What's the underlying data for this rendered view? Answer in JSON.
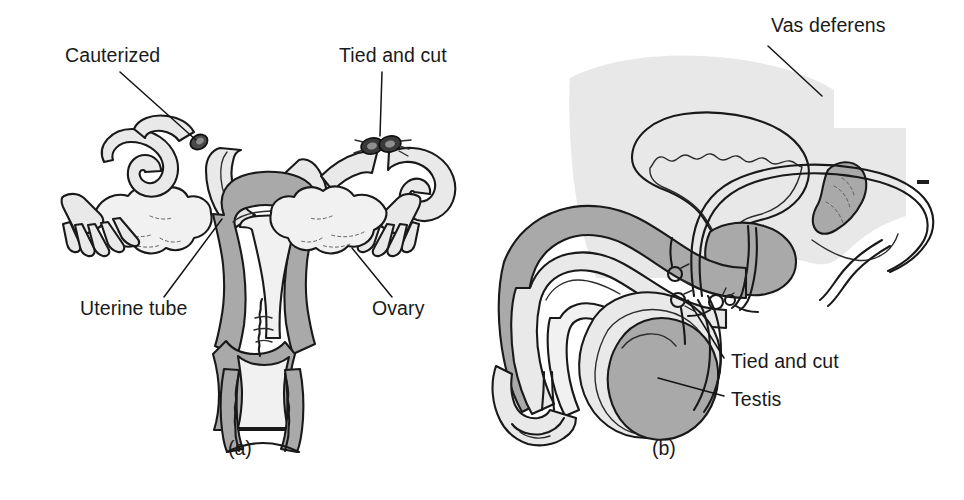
{
  "figure": {
    "background_color": "#ffffff",
    "ink_color": "#191919",
    "fill_mid_color": "#a9a9a9",
    "fill_light_color": "#e9e9e9",
    "fill_background_color": "#e8e8e8"
  },
  "panels": [
    {
      "id": "a",
      "caption": "(a)",
      "subject": "female-reproductive-tract",
      "labels": [
        {
          "name": "cauterized",
          "text": "Cauterized",
          "x": 65,
          "y": 56,
          "points_to": "left-uterine-tube-cut-end"
        },
        {
          "name": "tied-and-cut",
          "text": "Tied and cut",
          "x": 339,
          "y": 56,
          "points_to": "right-uterine-tube-ligature"
        },
        {
          "name": "uterine-tube",
          "text": "Uterine tube",
          "x": 80,
          "y": 309,
          "points_to": "left-uterine-tube"
        },
        {
          "name": "ovary",
          "text": "Ovary",
          "x": 372,
          "y": 309,
          "points_to": "right-ovary"
        }
      ],
      "structures": [
        "uterus",
        "uterine-cavity",
        "cervix",
        "vagina",
        "left-uterine-tube",
        "right-uterine-tube",
        "left-ovary",
        "right-ovary",
        "left-fimbriae",
        "right-fimbriae"
      ]
    },
    {
      "id": "b",
      "caption": "(b)",
      "subject": "male-reproductive-tract",
      "labels": [
        {
          "name": "vas-deferens",
          "text": "Vas deferens",
          "x": 771,
          "y": 25,
          "points_to": "vas-deferens-loop"
        },
        {
          "name": "tied-and-cut",
          "text": "Tied and cut",
          "x": 731,
          "y": 362,
          "points_to": "vas-deferens-ligature"
        },
        {
          "name": "testis",
          "text": "Testis",
          "x": 731,
          "y": 400,
          "points_to": "testis"
        }
      ],
      "structures": [
        "urinary-bladder",
        "prostate-gland",
        "seminal-vesicle",
        "vas-deferens",
        "urethra",
        "penis",
        "glans-penis",
        "scrotum",
        "testis",
        "epididymis"
      ]
    }
  ],
  "captions": [
    {
      "name": "caption-a",
      "text": "(a)",
      "x": 228,
      "y": 447
    },
    {
      "name": "caption-b",
      "text": "(b)",
      "x": 652,
      "y": 447
    }
  ],
  "artifacts": [
    {
      "name": "edge-dash-artifact",
      "x": 917,
      "y": 180,
      "width": 12,
      "height": 4
    }
  ]
}
